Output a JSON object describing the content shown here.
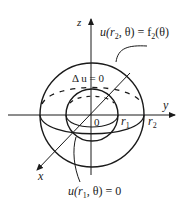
{
  "diagram": {
    "axes": {
      "z_label": "z",
      "y_label": "y",
      "x_label": "x",
      "origin_label": "0"
    },
    "radii": {
      "inner_label": "r",
      "inner_sub": "1",
      "outer_label": "r",
      "outer_sub": "2"
    },
    "equations": {
      "laplace": "Δ u = 0",
      "outer_bc_u": "u(r",
      "outer_bc_sub": "2",
      "outer_bc_mid": ", θ) = f",
      "outer_bc_fsub": "2",
      "outer_bc_end": "(θ)",
      "inner_bc_u": "u(r",
      "inner_bc_sub": "1",
      "inner_bc_end": ", θ) = 0"
    },
    "colors": {
      "stroke": "#1a1a1a",
      "background": "#ffffff"
    }
  }
}
